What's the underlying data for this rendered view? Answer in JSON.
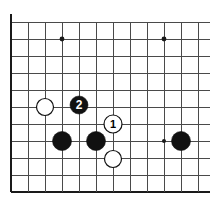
{
  "diagram": {
    "kind": "go-board-diagram",
    "board": {
      "background_color": "#ffffff",
      "line_color": "#4a4a4a",
      "edge_color": "#1a1a1a",
      "grid_spacing": 17,
      "origin_x": 11,
      "origin_y": 22,
      "columns": 12,
      "rows": 11,
      "edges": {
        "left": "thick",
        "top": "thin",
        "bottom": "thick",
        "right": "cropped"
      }
    },
    "star_points": [
      {
        "name": "star-point-upper-left",
        "x": 62,
        "y": 39,
        "radius": 2.4
      },
      {
        "name": "star-point-upper-right",
        "x": 164,
        "y": 39,
        "radius": 2.4
      },
      {
        "name": "star-point-lower-right",
        "x": 164,
        "y": 141,
        "radius": 2.0
      }
    ],
    "stones": [
      {
        "id": "white-stone-a",
        "color": "white",
        "x": 45,
        "y": 107,
        "radius": 8.5,
        "label": ""
      },
      {
        "id": "black-move-2",
        "color": "black",
        "x": 79,
        "y": 105,
        "radius": 9.0,
        "label": "2"
      },
      {
        "id": "white-move-1",
        "color": "white",
        "x": 113,
        "y": 124,
        "radius": 9.0,
        "label": "1"
      },
      {
        "id": "black-stone-b",
        "color": "black",
        "x": 62,
        "y": 141,
        "radius": 9.5,
        "label": ""
      },
      {
        "id": "black-stone-c",
        "color": "black",
        "x": 96,
        "y": 141,
        "radius": 9.5,
        "label": ""
      },
      {
        "id": "black-stone-d",
        "color": "black",
        "x": 181,
        "y": 141,
        "radius": 9.5,
        "label": ""
      },
      {
        "id": "white-stone-e",
        "color": "white",
        "x": 113,
        "y": 159,
        "radius": 8.5,
        "label": ""
      }
    ],
    "move_labels": [
      {
        "id": "label-move-1",
        "text": "1",
        "on": "white",
        "x": 113,
        "y": 124
      },
      {
        "id": "label-move-2",
        "text": "2",
        "on": "black",
        "x": 79,
        "y": 105
      }
    ],
    "colors": {
      "black_stone_fill": "#111111",
      "white_stone_fill": "#ffffff",
      "white_stone_stroke": "#111111",
      "grid_line": "#4a4a4a",
      "board_edge": "#1a1a1a"
    }
  }
}
